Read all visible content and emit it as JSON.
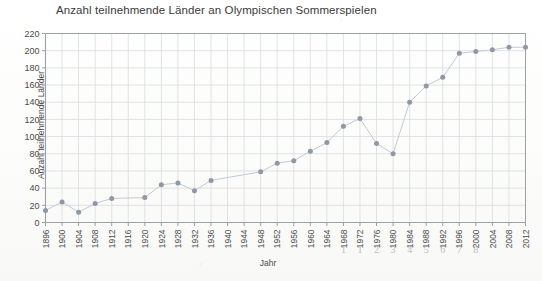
{
  "chart_data": {
    "type": "scatter",
    "title": "Anzahl teilnehmende Länder an Olympischen Sommerspielen",
    "xlabel": "Jahr",
    "ylabel": "Anzahl teilnehmende Länder",
    "ylim": [
      0,
      220
    ],
    "ytick_step": 20,
    "yticks": [
      0,
      20,
      40,
      60,
      80,
      100,
      120,
      140,
      160,
      180,
      200,
      220
    ],
    "xlim": [
      1896,
      2012
    ],
    "xticks": [
      1896,
      1900,
      1904,
      1908,
      1912,
      1916,
      1920,
      1924,
      1928,
      1932,
      1936,
      1940,
      1944,
      1948,
      1952,
      1956,
      1960,
      1964,
      1968,
      1972,
      1976,
      1980,
      1984,
      1988,
      1992,
      1996,
      2000,
      2004,
      2008,
      2012
    ],
    "grid": true,
    "legend": false,
    "marker_color": "#8d99a6",
    "grid_color": "#d8dce0",
    "axis_color": "#9aa0a6",
    "points": [
      {
        "x": 1896,
        "y": 14
      },
      {
        "x": 1900,
        "y": 24
      },
      {
        "x": 1904,
        "y": 12
      },
      {
        "x": 1908,
        "y": 22
      },
      {
        "x": 1912,
        "y": 28
      },
      {
        "x": 1920,
        "y": 29
      },
      {
        "x": 1924,
        "y": 44
      },
      {
        "x": 1928,
        "y": 46
      },
      {
        "x": 1932,
        "y": 37
      },
      {
        "x": 1936,
        "y": 49
      },
      {
        "x": 1948,
        "y": 59
      },
      {
        "x": 1952,
        "y": 69
      },
      {
        "x": 1956,
        "y": 72
      },
      {
        "x": 1960,
        "y": 83
      },
      {
        "x": 1964,
        "y": 93
      },
      {
        "x": 1968,
        "y": 112
      },
      {
        "x": 1972,
        "y": 121
      },
      {
        "x": 1976,
        "y": 92
      },
      {
        "x": 1980,
        "y": 80
      },
      {
        "x": 1984,
        "y": 140
      },
      {
        "x": 1988,
        "y": 159
      },
      {
        "x": 1992,
        "y": 169
      },
      {
        "x": 1996,
        "y": 197
      },
      {
        "x": 2000,
        "y": 199
      },
      {
        "x": 2004,
        "y": 201
      },
      {
        "x": 2008,
        "y": 204
      },
      {
        "x": 2012,
        "y": 204
      }
    ],
    "missing_years": [
      1916,
      1940,
      1944
    ],
    "annotations": [
      {
        "text": "1",
        "x": 1968
      },
      {
        "text": "1",
        "x": 1972
      },
      {
        "text": "2",
        "x": 1976
      },
      {
        "text": "3",
        "x": 1980
      },
      {
        "text": "4",
        "x": 1984
      },
      {
        "text": "5",
        "x": 1988
      },
      {
        "text": "6",
        "x": 1992
      },
      {
        "text": "7",
        "x": 1996
      },
      {
        "text": "8",
        "x": 2000
      },
      {
        "text": "'",
        "x": 2004
      }
    ]
  }
}
